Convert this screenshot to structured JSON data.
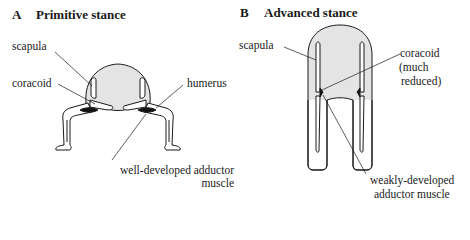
{
  "panels": [
    {
      "letter": "A",
      "title": "Primitive stance",
      "labels": {
        "scapula": "scapula",
        "coracoid": "coracoid",
        "humerus": "humerus",
        "muscle_line1": "well-developed adductor",
        "muscle_line2": "muscle"
      }
    },
    {
      "letter": "B",
      "title": "Advanced stance",
      "labels": {
        "scapula": "scapula",
        "coracoid_line1": "coracoid",
        "coracoid_line2": "(much",
        "coracoid_line3": "reduced)",
        "muscle_line1": "weakly-developed",
        "muscle_line2": "adductor muscle"
      }
    }
  ],
  "colors": {
    "body_fill": "#e4e4e4",
    "outline": "#1a1a1a",
    "muscle": "#111111",
    "bone_fill": "#ffffff"
  }
}
